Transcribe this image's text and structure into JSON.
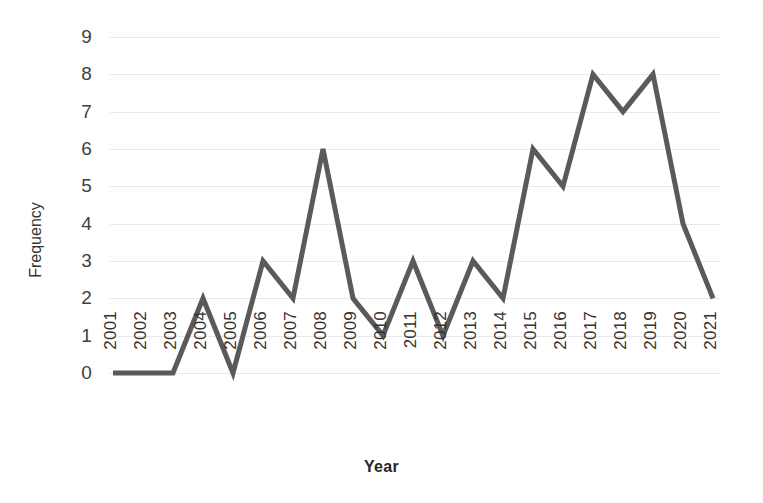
{
  "chart_data": {
    "type": "line",
    "title": "",
    "xlabel": "Year",
    "ylabel": "Frequency",
    "categories": [
      "2001",
      "2002",
      "2003",
      "2004",
      "2005",
      "2006",
      "2007",
      "2008",
      "2009",
      "2010",
      "2011",
      "2012",
      "2013",
      "2014",
      "2015",
      "2016",
      "2017",
      "2018",
      "2019",
      "2020",
      "2021"
    ],
    "values": [
      0,
      0,
      0,
      2,
      0,
      3,
      2,
      6,
      2,
      1,
      3,
      1,
      3,
      2,
      6,
      5,
      8,
      7,
      8,
      4,
      2
    ],
    "series": [
      {
        "name": "Frequency",
        "values": [
          0,
          0,
          0,
          2,
          0,
          3,
          2,
          6,
          2,
          1,
          3,
          1,
          3,
          2,
          6,
          5,
          8,
          7,
          8,
          4,
          2
        ]
      }
    ],
    "ylim": [
      0,
      9
    ],
    "y_ticks": [
      0,
      1,
      2,
      3,
      4,
      5,
      6,
      7,
      8,
      9
    ],
    "y_tick_labels": [
      "0",
      "1",
      "2",
      "3",
      "4",
      "5",
      "6",
      "7",
      "8",
      "9"
    ],
    "grid": "horizontal",
    "legend": "none",
    "line_color": "#5a5a5a",
    "gridline_color": "#e9e9e9",
    "background_color": "#ffffff",
    "markers": "none",
    "line_width": 5
  }
}
